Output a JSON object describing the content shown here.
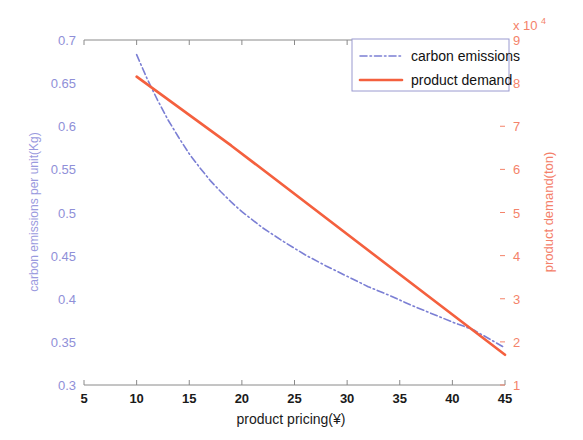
{
  "figure": {
    "background": "#ffffff",
    "width": 583,
    "height": 440
  },
  "chart_data": {
    "type": "line",
    "title": "",
    "xlabel": "product pricing(¥)",
    "ylabel": "carbon emissions per unit(Kg)",
    "y2label": "product demand(ton)",
    "y2_exponent_label": "x 10",
    "y2_exponent_power": "4",
    "xlim": [
      5,
      45
    ],
    "ylim": [
      0.3,
      0.7
    ],
    "y2lim": [
      1,
      9
    ],
    "xticks": [
      5,
      10,
      15,
      20,
      25,
      30,
      35,
      40,
      45
    ],
    "xticklabels": [
      "5",
      "10",
      "15",
      "20",
      "25",
      "30",
      "35",
      "40",
      "45"
    ],
    "yticks": [
      0.3,
      0.35,
      0.4,
      0.45,
      0.5,
      0.55,
      0.6,
      0.65,
      0.7
    ],
    "yticklabels": [
      "0.3",
      "0.35",
      "0.4",
      "0.45",
      "0.5",
      "0.55",
      "0.6",
      "0.65",
      "0.7"
    ],
    "y2ticks": [
      1,
      2,
      3,
      4,
      5,
      6,
      7,
      8,
      9
    ],
    "y2ticklabels": [
      "1",
      "2",
      "3",
      "4",
      "5",
      "6",
      "7",
      "8",
      "9"
    ],
    "grid": false,
    "legend_position": "top-right",
    "series": [
      {
        "name": "carbon emissions",
        "axis": "left",
        "color": "#7b7fd4",
        "style": "dash-dot",
        "width": 1.6,
        "x": [
          10,
          11,
          12,
          13,
          14,
          15,
          16,
          17,
          18,
          19,
          20,
          22,
          24,
          26,
          28,
          30,
          32,
          34,
          36,
          38,
          40,
          42,
          45
        ],
        "y": [
          0.683,
          0.655,
          0.63,
          0.607,
          0.587,
          0.568,
          0.552,
          0.537,
          0.524,
          0.512,
          0.501,
          0.482,
          0.466,
          0.451,
          0.438,
          0.426,
          0.414,
          0.404,
          0.393,
          0.383,
          0.373,
          0.364,
          0.343
        ]
      },
      {
        "name": "product demand",
        "axis": "right",
        "color": "#f4603e",
        "style": "solid",
        "width": 2.6,
        "x": [
          10,
          19,
          45
        ],
        "y2": [
          8.15,
          6.55,
          1.7
        ],
        "y2_units": "x10^4 ton"
      }
    ],
    "legend_entries": [
      {
        "label": "carbon emissions",
        "color": "#7b7fd4",
        "style": "dash-dot"
      },
      {
        "label": "product demand",
        "color": "#f4603e",
        "style": "solid"
      }
    ],
    "annotations": [
      {
        "text": "curves intersect near x = 42.7",
        "visible": false
      }
    ]
  }
}
